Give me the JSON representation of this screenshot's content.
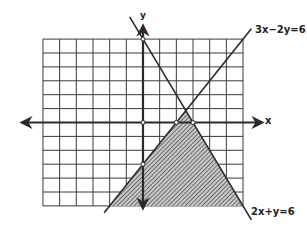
{
  "chart_data": {
    "type": "line",
    "title": "",
    "xlabel": "x",
    "ylabel": "y",
    "xlim": [
      -6,
      6
    ],
    "ylim": [
      -6,
      6
    ],
    "grid": true,
    "grid_step": 1,
    "series": [
      {
        "name": "3x-2y=6",
        "equation": "3x-2y=6",
        "points": [
          [
            -2.33,
            -6.5
          ],
          [
            6.5,
            6.75
          ]
        ],
        "intercepts": {
          "x": 2,
          "y": -3
        }
      },
      {
        "name": "2x+y=6",
        "equation": "2x+y=6",
        "points": [
          [
            -0.8,
            7.6
          ],
          [
            6.5,
            -7
          ]
        ],
        "intercepts": {
          "x": 3,
          "y": 6
        }
      }
    ],
    "shaded_region": {
      "description": "3x-2y>=6 and 2x+y<=6, within grid",
      "vertices": [
        [
          -2,
          -6
        ],
        [
          2.571,
          0.857
        ],
        [
          6,
          -6
        ]
      ],
      "fill": "hatched"
    },
    "marked_points": [
      [
        0,
        6
      ],
      [
        0,
        0
      ],
      [
        2,
        0
      ],
      [
        3,
        0
      ],
      [
        0,
        -3
      ]
    ],
    "annotations": [
      "3x-2y=6",
      "2x+y=6"
    ]
  },
  "labels": {
    "x_axis": "x",
    "y_axis": "y",
    "line1": "3x−2y=6",
    "line2": "2x+y=6"
  },
  "colors": {
    "ink": "#2a2a2a",
    "grid": "#3a3a3a",
    "hatch": "#555555",
    "background": "#ffffff"
  }
}
